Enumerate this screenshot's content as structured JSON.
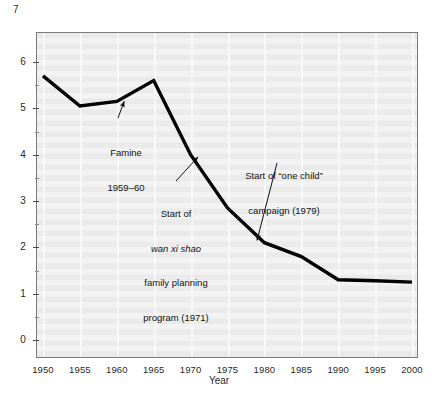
{
  "figure": {
    "corner_axis_max_label": "7",
    "background_color": "#ffffff",
    "panel_color": "#eaeaea",
    "series_color": "#000000"
  },
  "chart_data": {
    "type": "line",
    "title": "",
    "subtitle": "",
    "xlabel": "Year",
    "ylabel": "",
    "xlim": [
      1950,
      2000
    ],
    "ylim": [
      0,
      7
    ],
    "grid": "vertical-only",
    "legend": "none",
    "x": [
      1950,
      1955,
      1960,
      1965,
      1970,
      1975,
      1980,
      1985,
      1990,
      1995,
      2000
    ],
    "values": [
      5.7,
      5.05,
      5.15,
      5.6,
      4.0,
      2.85,
      2.1,
      1.8,
      1.3,
      1.28,
      1.25
    ],
    "series": [
      {
        "name": "Total fertility rate",
        "values": [
          5.7,
          5.05,
          5.15,
          5.6,
          4.0,
          2.85,
          2.1,
          1.8,
          1.3,
          1.28,
          1.25
        ]
      }
    ],
    "xticks": [
      "1950",
      "1955",
      "1960",
      "1965",
      "1970",
      "1975",
      "1980",
      "1985",
      "1990",
      "1995",
      "2000"
    ],
    "yticks": [
      "0",
      "1",
      "2",
      "3",
      "4",
      "5",
      "6"
    ],
    "y_minor_ticks": [
      0.5,
      1.5,
      2.5,
      3.5,
      4.5,
      5.5
    ],
    "annotations": [
      {
        "id": "famine",
        "line1": "Famine",
        "line2": "1959–60",
        "target_x": 1961,
        "target_y": 5.15
      },
      {
        "id": "wan-xi-shao",
        "line1": "Start of",
        "line2": "wan xi shao",
        "line2_style": "italic",
        "line3": "family planning",
        "line4": "program (1971)",
        "target_x": 1971,
        "target_y": 3.95
      },
      {
        "id": "one-child",
        "line1": "Start of “one child”",
        "line2": "campaign (1979)",
        "target_x": 1979,
        "target_y": 2.15
      }
    ]
  }
}
